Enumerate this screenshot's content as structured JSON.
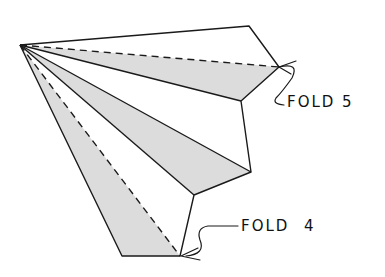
{
  "diagram": {
    "labels": {
      "fold5": "FOLD 5",
      "fold4": "FOLD 4"
    },
    "colors": {
      "stroke": "#1a1a1a",
      "shade": "#dcdcdc",
      "background": "#ffffff"
    }
  }
}
